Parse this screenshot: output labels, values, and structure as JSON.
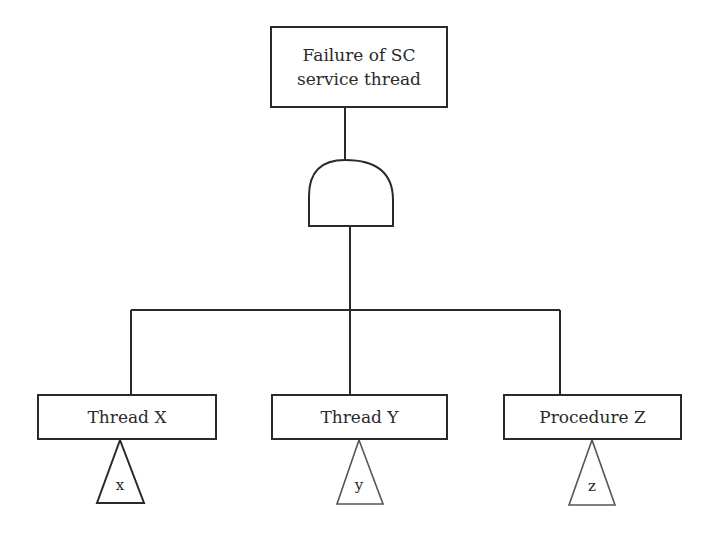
{
  "diagram": {
    "type": "fault-tree",
    "top_event": {
      "label_line1": "Failure of SC",
      "label_line2": "service thread"
    },
    "gate": {
      "type": "AND"
    },
    "basic_events": [
      {
        "label": "Thread X",
        "transfer": "x"
      },
      {
        "label": "Thread Y",
        "transfer": "y"
      },
      {
        "label": "Procedure Z",
        "transfer": "z"
      }
    ],
    "colors": {
      "line": "#2a2a2a",
      "background": "#ffffff"
    }
  }
}
